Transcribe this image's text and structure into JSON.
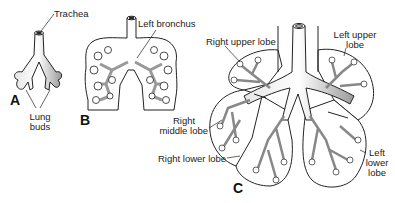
{
  "figure": {
    "panels": [
      {
        "id": "A",
        "label": "A"
      },
      {
        "id": "B",
        "label": "B"
      },
      {
        "id": "C",
        "label": "C"
      }
    ],
    "labels": {
      "trachea": "Trachea",
      "lung_buds_1": "Lung",
      "lung_buds_2": "buds",
      "left_bronchus": "Left bronchus",
      "right_upper_lobe": "Right upper lobe",
      "left_upper_lobe_1": "Left upper",
      "left_upper_lobe_2": "lobe",
      "right_middle_lobe_1": "Right",
      "right_middle_lobe_2": "middle lobe",
      "right_lower_lobe": "Right lower lobe",
      "left_lower_lobe_1": "Left",
      "left_lower_lobe_2": "lower",
      "left_lower_lobe_3": "lobe"
    },
    "colors": {
      "line": "#222222",
      "fill": "#ffffff",
      "shade": "#bdbdbd"
    }
  }
}
